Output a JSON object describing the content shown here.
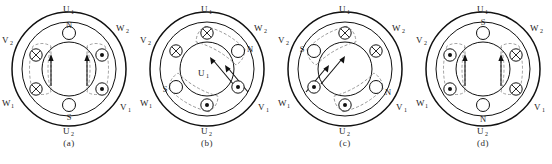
{
  "figure": {
    "panels": [
      {
        "id": "a",
        "caption": "(a)",
        "labels": {
          "top": "U",
          "top_sub": "1",
          "bottom": "U",
          "bottom_sub": "2",
          "upper_left": "V",
          "upper_left_sub": "2",
          "lower_left": "W",
          "lower_left_sub": "1",
          "upper_right": "W",
          "upper_right_sub": "2",
          "lower_right": "V",
          "lower_right_sub": "1"
        },
        "center_label": "",
        "north_pole": "N",
        "south_pole": "S",
        "north_angle_deg": 90,
        "south_angle_deg": 270,
        "field_angle_deg": 90,
        "conductors": [
          {
            "angle_deg": 150,
            "current": "into"
          },
          {
            "angle_deg": 210,
            "current": "into"
          },
          {
            "angle_deg": 30,
            "current": "out"
          },
          {
            "angle_deg": 330,
            "current": "out"
          }
        ],
        "flux_arrows": "vertical-up"
      },
      {
        "id": "b",
        "caption": "(b)",
        "labels": {
          "top": "U",
          "top_sub": "1",
          "bottom": "U",
          "bottom_sub": "2",
          "upper_left": "V",
          "upper_left_sub": "2",
          "lower_left": "W",
          "lower_left_sub": "1",
          "upper_right": "W",
          "upper_right_sub": "2",
          "lower_right": "V",
          "lower_right_sub": "1"
        },
        "center_label": "U",
        "center_label_sub": "1",
        "north_pole": "N",
        "south_pole": "S",
        "north_angle_deg": 30,
        "south_angle_deg": 210,
        "field_angle_deg": 150,
        "conductors": [
          {
            "angle_deg": 90,
            "current": "into"
          },
          {
            "angle_deg": 150,
            "current": "into"
          },
          {
            "angle_deg": 330,
            "current": "out"
          },
          {
            "angle_deg": 270,
            "current": "out"
          }
        ],
        "flux_arrows": "diagonal-up-left"
      },
      {
        "id": "c",
        "caption": "(c)",
        "labels": {
          "top": "U",
          "top_sub": "1",
          "bottom": "U",
          "bottom_sub": "2",
          "upper_left": "V",
          "upper_left_sub": "2",
          "lower_left": "W",
          "lower_left_sub": "1",
          "upper_right": "W",
          "upper_right_sub": "2",
          "lower_right": "V",
          "lower_right_sub": "1"
        },
        "center_label": "",
        "north_pole": "N",
        "south_pole": "S",
        "north_angle_deg": 330,
        "south_angle_deg": 150,
        "field_angle_deg": 30,
        "conductors": [
          {
            "angle_deg": 90,
            "current": "into"
          },
          {
            "angle_deg": 30,
            "current": "into"
          },
          {
            "angle_deg": 210,
            "current": "out"
          },
          {
            "angle_deg": 270,
            "current": "out"
          }
        ],
        "flux_arrows": "diagonal-up-right"
      },
      {
        "id": "d",
        "caption": "(d)",
        "labels": {
          "top": "U",
          "top_sub": "1",
          "bottom": "U",
          "bottom_sub": "2",
          "upper_left": "V",
          "upper_left_sub": "2",
          "lower_left": "W",
          "lower_left_sub": "1",
          "upper_right": "W",
          "upper_right_sub": "2",
          "lower_right": "V",
          "lower_right_sub": "1"
        },
        "center_label": "",
        "north_pole": "S",
        "south_pole": "N",
        "north_angle_deg": 90,
        "south_angle_deg": 270,
        "field_angle_deg": 270,
        "conductors": [
          {
            "angle_deg": 150,
            "current": "out"
          },
          {
            "angle_deg": 210,
            "current": "out"
          },
          {
            "angle_deg": 30,
            "current": "into"
          },
          {
            "angle_deg": 330,
            "current": "into"
          }
        ],
        "flux_arrows": "vertical-up"
      }
    ],
    "symbols": {
      "current_into_page": "cross-in-circle",
      "current_out_of_page": "dot-in-circle"
    }
  }
}
